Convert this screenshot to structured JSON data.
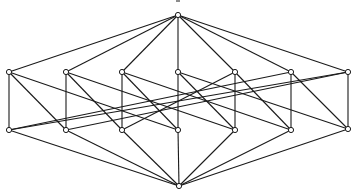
{
  "diagram": {
    "type": "hasse-diagram",
    "stroke_color": "#1a1a1a",
    "node_fill": "#ffffff",
    "node_radius": 2.6,
    "nodes": [
      {
        "id": "T",
        "x": 178,
        "y": 15
      },
      {
        "id": "U1",
        "x": 9,
        "y": 72
      },
      {
        "id": "U2",
        "x": 66,
        "y": 72
      },
      {
        "id": "U3",
        "x": 122,
        "y": 72
      },
      {
        "id": "U4",
        "x": 178,
        "y": 72
      },
      {
        "id": "U5",
        "x": 235,
        "y": 72
      },
      {
        "id": "U6",
        "x": 291,
        "y": 72
      },
      {
        "id": "U7",
        "x": 348,
        "y": 72
      },
      {
        "id": "L1",
        "x": 9,
        "y": 130
      },
      {
        "id": "L2",
        "x": 66,
        "y": 130
      },
      {
        "id": "L3",
        "x": 122,
        "y": 130
      },
      {
        "id": "L4",
        "x": 178,
        "y": 130
      },
      {
        "id": "L5",
        "x": 235,
        "y": 130
      },
      {
        "id": "L6",
        "x": 291,
        "y": 130
      },
      {
        "id": "L7",
        "x": 348,
        "y": 129
      },
      {
        "id": "B",
        "x": 179,
        "y": 186
      }
    ],
    "edges": [
      [
        "T",
        "U1"
      ],
      [
        "T",
        "U2"
      ],
      [
        "T",
        "U3"
      ],
      [
        "T",
        "U4"
      ],
      [
        "T",
        "U5"
      ],
      [
        "T",
        "U6"
      ],
      [
        "T",
        "U7"
      ],
      [
        "U1",
        "L1"
      ],
      [
        "U2",
        "L2"
      ],
      [
        "U3",
        "L3"
      ],
      [
        "U4",
        "L4"
      ],
      [
        "U5",
        "L5"
      ],
      [
        "U6",
        "L6"
      ],
      [
        "U7",
        "L7"
      ],
      [
        "U1",
        "L2"
      ],
      [
        "U1",
        "L4"
      ],
      [
        "U2",
        "L3"
      ],
      [
        "U2",
        "L5"
      ],
      [
        "U3",
        "L4"
      ],
      [
        "U3",
        "L6"
      ],
      [
        "U4",
        "L5"
      ],
      [
        "U4",
        "L7"
      ],
      [
        "U5",
        "L6"
      ],
      [
        "U5",
        "L3"
      ],
      [
        "U6",
        "L7"
      ],
      [
        "U6",
        "L1"
      ],
      [
        "U7",
        "L1"
      ],
      [
        "U7",
        "L2"
      ],
      [
        "B",
        "L1"
      ],
      [
        "B",
        "L2"
      ],
      [
        "B",
        "L3"
      ],
      [
        "B",
        "L4"
      ],
      [
        "B",
        "L5"
      ],
      [
        "B",
        "L6"
      ],
      [
        "B",
        "L7"
      ]
    ]
  }
}
